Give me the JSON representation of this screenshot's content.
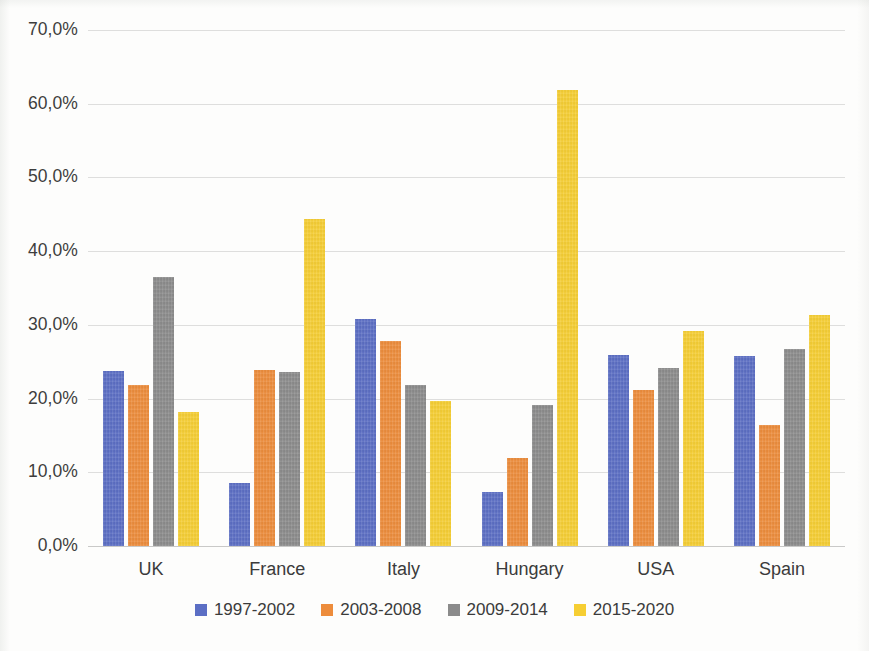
{
  "chart_data": {
    "type": "bar",
    "title": "",
    "subtitle": "",
    "xlabel": "",
    "ylabel": "",
    "categories": [
      "UK",
      "France",
      "Italy",
      "Hungary",
      "USA",
      "Spain"
    ],
    "series": [
      {
        "name": "1997-2002",
        "color": "#5B6EC4",
        "values": [
          23.7,
          8.6,
          30.8,
          7.3,
          25.9,
          25.8
        ]
      },
      {
        "name": "2003-2008",
        "color": "#ED8C3B",
        "values": [
          21.8,
          23.9,
          27.8,
          12.0,
          21.1,
          16.4
        ]
      },
      {
        "name": "2009-2014",
        "color": "#8B8B8B",
        "values": [
          36.5,
          23.6,
          21.9,
          19.1,
          24.2,
          26.7
        ]
      },
      {
        "name": "2015-2020",
        "color": "#F6CE33",
        "values": [
          18.2,
          44.3,
          19.7,
          61.9,
          29.2,
          31.4
        ]
      }
    ],
    "ylim": [
      0,
      70
    ],
    "ytick_values": [
      0,
      10,
      20,
      30,
      40,
      50,
      60,
      70
    ],
    "ytick_labels": [
      "0,0%",
      "10,0%",
      "20,0%",
      "30,0%",
      "40,0%",
      "50,0%",
      "60,0%",
      "70,0%"
    ],
    "grid": true,
    "grid_color": "#dededd",
    "legend_position": "bottom",
    "background": "#fdfdfc",
    "bar_grouping": "clustered"
  },
  "axis": {
    "y_tick_labels": [
      "70,0%",
      "60,0%",
      "50,0%",
      "40,0%",
      "30,0%",
      "20,0%",
      "10,0%",
      "0,0%"
    ],
    "x_tick_labels": [
      "UK",
      "France",
      "Italy",
      "Hungary",
      "USA",
      "Spain"
    ]
  },
  "legend": {
    "items": [
      {
        "label": "1997-2002",
        "color": "#5B6EC4"
      },
      {
        "label": "2003-2008",
        "color": "#ED8C3B"
      },
      {
        "label": "2009-2014",
        "color": "#8B8B8B"
      },
      {
        "label": "2015-2020",
        "color": "#F6CE33"
      }
    ]
  }
}
